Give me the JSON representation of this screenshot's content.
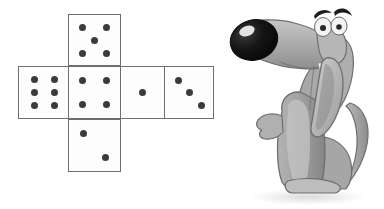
{
  "scene": {
    "title": "Die net with cartoon dog",
    "background_color": "#ffffff"
  },
  "die_net": {
    "name": "cube-net-cross-layout",
    "face_border_color": "#6e6e6e",
    "face_fill_color": "#fdfdfd",
    "pip_color": "#3b3b3b",
    "face_size_px": 53,
    "faces": [
      {
        "id": "top",
        "position": "top",
        "pip_count": 5,
        "label": "5",
        "x": 68,
        "y": 14,
        "w": 53,
        "h": 52,
        "pips": [
          {
            "x": 0.27,
            "y": 0.25
          },
          {
            "x": 0.73,
            "y": 0.25
          },
          {
            "x": 0.5,
            "y": 0.5
          },
          {
            "x": 0.27,
            "y": 0.76
          },
          {
            "x": 0.73,
            "y": 0.76
          }
        ]
      },
      {
        "id": "left",
        "position": "middle-left",
        "pip_count": 6,
        "label": "6",
        "x": 18,
        "y": 66,
        "w": 53,
        "h": 53,
        "pips": [
          {
            "x": 0.3,
            "y": 0.24
          },
          {
            "x": 0.7,
            "y": 0.24
          },
          {
            "x": 0.3,
            "y": 0.5
          },
          {
            "x": 0.7,
            "y": 0.5
          },
          {
            "x": 0.3,
            "y": 0.76
          },
          {
            "x": 0.7,
            "y": 0.76
          }
        ]
      },
      {
        "id": "center",
        "position": "middle-center",
        "pip_count": 4,
        "label": "4",
        "x": 68,
        "y": 66,
        "w": 53,
        "h": 53,
        "pips": [
          {
            "x": 0.27,
            "y": 0.27
          },
          {
            "x": 0.73,
            "y": 0.27
          },
          {
            "x": 0.27,
            "y": 0.73
          },
          {
            "x": 0.73,
            "y": 0.73
          }
        ]
      },
      {
        "id": "right",
        "position": "middle-right",
        "pip_count": 1,
        "label": "1",
        "x": 120,
        "y": 66,
        "w": 45,
        "h": 53,
        "pips": [
          {
            "x": 0.5,
            "y": 0.5
          }
        ]
      },
      {
        "id": "far-right",
        "position": "middle-far-right",
        "pip_count": 3,
        "label": "3",
        "x": 164,
        "y": 66,
        "w": 50,
        "h": 53,
        "pips": [
          {
            "x": 0.28,
            "y": 0.26
          },
          {
            "x": 0.5,
            "y": 0.5
          },
          {
            "x": 0.75,
            "y": 0.76
          }
        ]
      },
      {
        "id": "bottom",
        "position": "bottom",
        "pip_count": 2,
        "label": "2",
        "x": 68,
        "y": 119,
        "w": 53,
        "h": 53,
        "pips": [
          {
            "x": 0.29,
            "y": 0.27
          },
          {
            "x": 0.72,
            "y": 0.74
          }
        ]
      }
    ]
  },
  "dog": {
    "name": "cartoon-dog-sitting",
    "description": "Grayscale cartoon dog sitting upright with head tilted back, large black nose, long floppy ears and curved tail",
    "colors": {
      "body": "#9a9a9a",
      "body_light": "#c8c8c8",
      "body_shadow": "#7e7e7e",
      "outline": "#6a6a6a",
      "nose": "#151515",
      "nose_highlight": "#f2f2f2",
      "eye_white": "#f4f4f4",
      "eye_pupil": "#2a2a2a",
      "brow": "#1c1c1c",
      "ground_shadow": "#e3e3e3"
    },
    "parts": [
      "nose",
      "muzzle",
      "head",
      "eye-left",
      "eye-right",
      "eyebrow-left",
      "eyebrow-right",
      "ear-left",
      "ear-right",
      "neck",
      "chest",
      "front-paw",
      "body",
      "haunch",
      "hind-paw",
      "tail"
    ]
  }
}
